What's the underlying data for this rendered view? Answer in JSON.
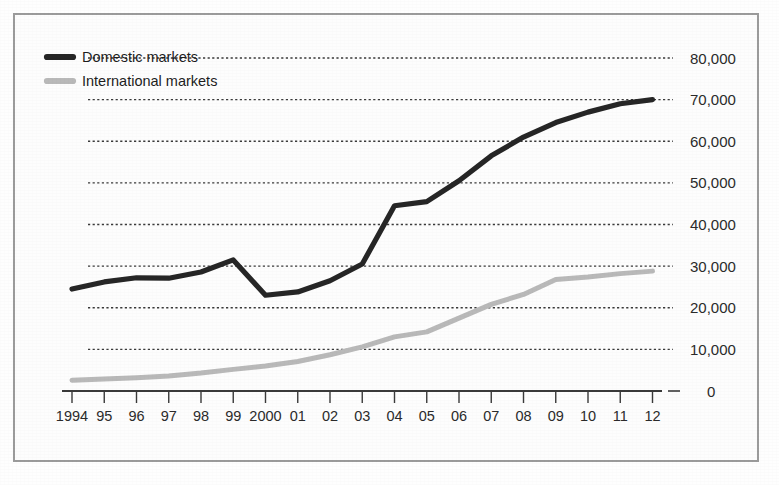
{
  "figure": {
    "background_color": "#fdfdfd",
    "border_color": "#9b9b9b"
  },
  "legend": {
    "position": "top-left",
    "entries": [
      {
        "label": "Domestic markets",
        "color": "#262626"
      },
      {
        "label": "International markets",
        "color": "#b9b9b9"
      }
    ]
  },
  "chart_data": {
    "type": "line",
    "title": "",
    "subtitle": "",
    "xlabel": "",
    "ylabel": "",
    "grid": true,
    "legend_position": "top-left",
    "x": [
      1994,
      1995,
      1996,
      1997,
      1998,
      1999,
      2000,
      2001,
      2002,
      2003,
      2004,
      2005,
      2006,
      2007,
      2008,
      2009,
      2010,
      2011,
      2012
    ],
    "categories": [
      "1994",
      "95",
      "96",
      "97",
      "98",
      "99",
      "2000",
      "01",
      "02",
      "03",
      "04",
      "05",
      "06",
      "07",
      "08",
      "09",
      "10",
      "11",
      "12"
    ],
    "xtick_labels": [
      "1994",
      "95",
      "96",
      "97",
      "98",
      "99",
      "2000",
      "01",
      "02",
      "03",
      "04",
      "05",
      "06",
      "07",
      "08",
      "09",
      "10",
      "11",
      "12"
    ],
    "ytick_labels": [
      "0",
      "10,000",
      "20,000",
      "30,000",
      "40,000",
      "50,000",
      "60,000",
      "70,000",
      "80,000"
    ],
    "ytick_values": [
      0,
      10000,
      20000,
      30000,
      40000,
      50000,
      60000,
      70000,
      80000
    ],
    "ylim": [
      0,
      80000
    ],
    "series": [
      {
        "name": "Domestic markets",
        "color": "#262626",
        "values": [
          24500,
          26200,
          27200,
          27100,
          28600,
          31500,
          23000,
          23800,
          26500,
          30500,
          44500,
          45500,
          50500,
          56500,
          61000,
          64500,
          67000,
          69000,
          70000
        ]
      },
      {
        "name": "International markets",
        "color": "#b9b9b9",
        "values": [
          2600,
          2900,
          3200,
          3600,
          4300,
          5200,
          6000,
          7100,
          8700,
          10600,
          13000,
          14200,
          17500,
          20800,
          23200,
          26800,
          27400,
          28200,
          28800
        ]
      }
    ]
  }
}
